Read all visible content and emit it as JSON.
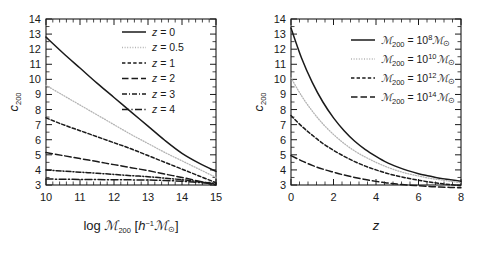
{
  "figure": {
    "background": "#ffffff",
    "ink_color": "#1a1a1a",
    "faint_color": "#b4b4b4"
  },
  "chart_data": [
    {
      "type": "line",
      "panel": "left",
      "title": "",
      "xlabel": "log ℳ200 [h−1ℳ⊙]",
      "ylabel": "c200",
      "xlim": [
        10,
        15
      ],
      "ylim": [
        3,
        14
      ],
      "xticks": [
        10,
        11,
        12,
        13,
        14,
        15
      ],
      "yticks": [
        3,
        4,
        5,
        6,
        7,
        8,
        9,
        10,
        11,
        12,
        13,
        14
      ],
      "grid": false,
      "legend_position": "upper right",
      "x": [
        10,
        10.5,
        11,
        11.5,
        12,
        12.5,
        13,
        13.5,
        14,
        14.5,
        15
      ],
      "series": [
        {
          "name": "z = 0",
          "style": "solid",
          "color": "#1a1a1a",
          "values": [
            12.8,
            11.75,
            10.75,
            9.75,
            8.8,
            7.85,
            6.9,
            5.95,
            5.1,
            4.45,
            3.9
          ]
        },
        {
          "name": "z = 0.5",
          "style": "dotted",
          "color": "#b4b4b4",
          "values": [
            9.6,
            8.95,
            8.3,
            7.65,
            7.0,
            6.35,
            5.75,
            5.15,
            4.6,
            4.05,
            3.5
          ]
        },
        {
          "name": "z = 1",
          "style": "dashed",
          "color": "#1a1a1a",
          "values": [
            7.45,
            7.0,
            6.6,
            6.2,
            5.8,
            5.4,
            4.95,
            4.5,
            4.05,
            3.6,
            3.15
          ]
        },
        {
          "name": "z = 2",
          "style": "longdash",
          "color": "#1a1a1a",
          "values": [
            5.15,
            4.95,
            4.75,
            4.55,
            4.35,
            4.15,
            3.95,
            3.72,
            3.5,
            3.25,
            3.0
          ]
        },
        {
          "name": "z = 3",
          "style": "dashdot",
          "color": "#1a1a1a",
          "values": [
            4.0,
            3.92,
            3.85,
            3.78,
            3.7,
            3.62,
            3.55,
            3.45,
            3.35,
            3.22,
            3.1
          ]
        },
        {
          "name": "z = 4",
          "style": "dashdotlong",
          "color": "#1a1a1a",
          "values": [
            3.4,
            3.38,
            3.37,
            3.36,
            3.35,
            3.34,
            3.33,
            3.3,
            3.25,
            3.17,
            3.08
          ]
        }
      ],
      "legend": [
        {
          "label_parts": {
            "var": "z",
            "rest": " = 0"
          },
          "style": "solid"
        },
        {
          "label_parts": {
            "var": "z",
            "rest": " = 0.5"
          },
          "style": "dotted"
        },
        {
          "label_parts": {
            "var": "z",
            "rest": " = 1"
          },
          "style": "dashed"
        },
        {
          "label_parts": {
            "var": "z",
            "rest": " = 2"
          },
          "style": "longdash"
        },
        {
          "label_parts": {
            "var": "z",
            "rest": " = 3"
          },
          "style": "dashdot"
        },
        {
          "label_parts": {
            "var": "z",
            "rest": " = 4"
          },
          "style": "dashdotlong"
        }
      ],
      "axis_label_x": {
        "prefix": "log ",
        "symbol": "ℳ",
        "sub": "200",
        "bracket_open": " [",
        "h": "h",
        "h_sup": "−1",
        "symbol2": "ℳ",
        "sub2": "⊙",
        "bracket_close": "]"
      },
      "axis_label_y": {
        "symbol": "c",
        "sub": "200"
      }
    },
    {
      "type": "line",
      "panel": "right",
      "title": "",
      "xlabel": "z",
      "ylabel": "c200",
      "xlim": [
        0,
        8
      ],
      "ylim": [
        3,
        14
      ],
      "xticks": [
        0,
        2,
        4,
        6,
        8
      ],
      "yticks": [
        3,
        4,
        5,
        6,
        7,
        8,
        9,
        10,
        11,
        12,
        13,
        14
      ],
      "grid": false,
      "legend_position": "upper right",
      "x": [
        0,
        0.5,
        1,
        1.5,
        2,
        2.5,
        3,
        3.5,
        4,
        4.5,
        5,
        5.5,
        6,
        6.5,
        7,
        7.5,
        8
      ],
      "series": [
        {
          "name": "M200 = 10^8 Msun",
          "style": "solid",
          "color": "#1a1a1a",
          "values": [
            13.4,
            11.4,
            9.8,
            8.5,
            7.45,
            6.6,
            5.9,
            5.35,
            4.9,
            4.5,
            4.2,
            3.95,
            3.75,
            3.6,
            3.45,
            3.35,
            3.25
          ]
        },
        {
          "name": "M200 = 10^10 Msun",
          "style": "dotted",
          "color": "#b4b4b4",
          "values": [
            10.1,
            8.9,
            7.9,
            7.05,
            6.35,
            5.75,
            5.25,
            4.85,
            4.5,
            4.2,
            3.95,
            3.75,
            3.6,
            3.45,
            3.35,
            3.25,
            3.15
          ]
        },
        {
          "name": "M200 = 10^12 Msun",
          "style": "dashed",
          "color": "#1a1a1a",
          "values": [
            7.6,
            6.9,
            6.3,
            5.75,
            5.3,
            4.9,
            4.55,
            4.25,
            4.0,
            3.78,
            3.6,
            3.45,
            3.32,
            3.2,
            3.1,
            3.02,
            2.95
          ]
        },
        {
          "name": "M200 = 10^14 Msun",
          "style": "longdash",
          "color": "#1a1a1a",
          "values": [
            4.95,
            4.6,
            4.3,
            4.05,
            3.85,
            3.66,
            3.5,
            3.36,
            3.24,
            3.14,
            3.06,
            3.0,
            2.95,
            2.9,
            2.87,
            2.84,
            2.82
          ]
        }
      ],
      "legend": [
        {
          "symbol": "ℳ",
          "sub": "200",
          "eq": " = 10",
          "sup": "8",
          "symbol2": "ℳ",
          "sub2": "⊙",
          "style": "solid"
        },
        {
          "symbol": "ℳ",
          "sub": "200",
          "eq": " = 10",
          "sup": "10",
          "symbol2": "ℳ",
          "sub2": "⊙",
          "style": "dotted"
        },
        {
          "symbol": "ℳ",
          "sub": "200",
          "eq": " = 10",
          "sup": "12",
          "symbol2": "ℳ",
          "sub2": "⊙",
          "style": "dashed"
        },
        {
          "symbol": "ℳ",
          "sub": "200",
          "eq": " = 10",
          "sup": "14",
          "symbol2": "ℳ",
          "sub2": "⊙",
          "style": "longdash"
        }
      ],
      "axis_label_x": {
        "symbol": "z"
      },
      "axis_label_y": {
        "symbol": "c",
        "sub": "200"
      }
    }
  ]
}
